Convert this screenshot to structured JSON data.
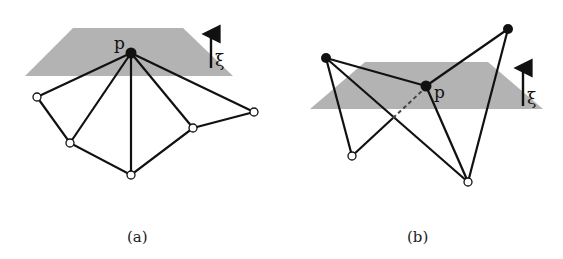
{
  "colors": {
    "plane": "#b3b3b3",
    "edge": "#111111",
    "node_black": "#111111",
    "node_white": "#ffffff"
  },
  "panels": [
    {
      "id": "a",
      "caption": "(a)",
      "point_label": "p",
      "normal_label": "ξ",
      "plane": [
        [
          73,
          28
        ],
        [
          183,
          28
        ],
        [
          233,
          76
        ],
        [
          25,
          76
        ]
      ],
      "p": [
        131,
        53
      ],
      "white_nodes": [
        [
          37,
          97
        ],
        [
          70,
          143
        ],
        [
          131,
          175
        ],
        [
          193,
          128
        ],
        [
          254,
          112
        ]
      ],
      "description": "Point p on plane with all neighbours on one side (below)"
    },
    {
      "id": "b",
      "caption": "(b)",
      "point_label": "p",
      "normal_label": "ξ",
      "plane": [
        [
          365,
          62
        ],
        [
          488,
          62
        ],
        [
          543,
          109
        ],
        [
          310,
          109
        ]
      ],
      "p": [
        426,
        86
      ],
      "black_nodes": [
        [
          326,
          58
        ],
        [
          508,
          29
        ]
      ],
      "white_nodes": [
        [
          352,
          156
        ],
        [
          468,
          182
        ]
      ],
      "description": "Point p on plane with neighbours on both sides; one edge passes behind the plane (dashed)"
    }
  ]
}
